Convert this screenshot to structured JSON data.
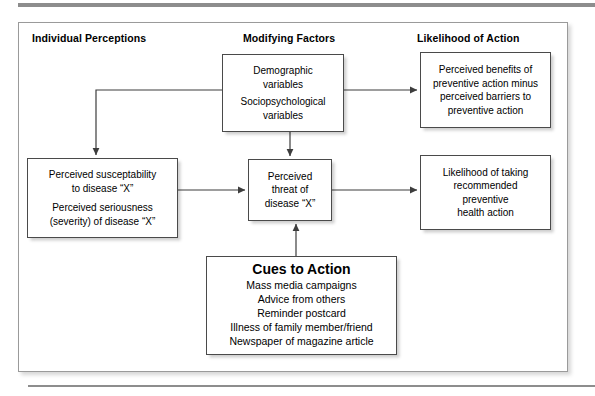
{
  "figure": {
    "headers": [
      {
        "id": "individual-perceptions",
        "label": "Individual Perceptions"
      },
      {
        "id": "modifying-factors",
        "label": "Modifying Factors"
      },
      {
        "id": "likelihood-of-action",
        "label": "Likelihood of Action"
      }
    ],
    "nodes": {
      "modifying": {
        "lines": [
          "Demographic",
          "variables",
          "Sociopsychological",
          "variables"
        ]
      },
      "benefits": {
        "lines": [
          "Perceived benefits of",
          "preventive action minus",
          "perceived barriers to",
          "preventive action"
        ]
      },
      "perceptions": {
        "lines": [
          "Perceived susceptability",
          "to disease “X”",
          "Perceived seriousness",
          "(severity) of disease “X”"
        ]
      },
      "threat": {
        "lines": [
          "Perceived",
          "threat of",
          "disease “X”"
        ]
      },
      "likelihood": {
        "lines": [
          "Likelihood of taking",
          "recommended",
          "preventive",
          "health action"
        ]
      },
      "cues": {
        "title": "Cues to Action",
        "lines": [
          "Mass media campaigns",
          "Advice from others",
          "Reminder postcard",
          "Illness of family member/friend",
          "Newspaper of magazine article"
        ]
      }
    },
    "connectors": [
      {
        "id": "modifying-to-perceptions",
        "from": "modifying",
        "to": "perceptions",
        "style": "elbow-left-down"
      },
      {
        "id": "modifying-to-benefits",
        "from": "modifying",
        "to": "benefits",
        "style": "straight-right"
      },
      {
        "id": "modifying-to-threat",
        "from": "modifying",
        "to": "threat",
        "style": "straight-down"
      },
      {
        "id": "perceptions-to-threat",
        "from": "perceptions",
        "to": "threat",
        "style": "straight-right"
      },
      {
        "id": "threat-to-likelihood",
        "from": "threat",
        "to": "likelihood",
        "style": "straight-right"
      },
      {
        "id": "cues-to-threat",
        "from": "cues",
        "to": "threat",
        "style": "straight-up"
      }
    ],
    "colors": {
      "background": "#ffffff",
      "frame_border": "#9a9a9a",
      "node_border": "#4a4a4a",
      "connector": "#4a4a4a",
      "rule": "#8d8d8d",
      "text": "#000000"
    }
  }
}
